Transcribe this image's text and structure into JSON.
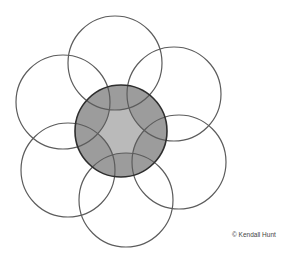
{
  "diagram": {
    "center_circle": {
      "cx": 121,
      "cy": 131,
      "r": 46,
      "fill": "#bababa",
      "stroke": "#2e2e2e"
    },
    "outer_circles": [
      {
        "name": "top",
        "cx": 115,
        "cy": 63,
        "r": 47
      },
      {
        "name": "upper-right",
        "cx": 174,
        "cy": 94,
        "r": 47
      },
      {
        "name": "lower-right",
        "cx": 179,
        "cy": 162,
        "r": 47
      },
      {
        "name": "bottom",
        "cx": 126,
        "cy": 200,
        "r": 47
      },
      {
        "name": "lower-left",
        "cx": 68,
        "cy": 170,
        "r": 47
      },
      {
        "name": "upper-left",
        "cx": 63,
        "cy": 102,
        "r": 47
      }
    ],
    "colors": {
      "outer_stroke": "#5c5c5c",
      "overlap_fill": "#9c9c9c",
      "background": "#ffffff"
    }
  },
  "credit": {
    "text": "© Kendall Hunt"
  }
}
